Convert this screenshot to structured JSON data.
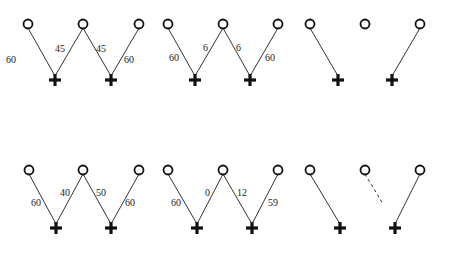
{
  "diagram": {
    "panels": [
      {
        "id": "p1",
        "circles": [
          [
            28,
            24
          ],
          [
            83,
            24
          ],
          [
            139,
            24
          ]
        ],
        "pluses": [
          [
            55,
            80
          ],
          [
            111,
            80
          ]
        ],
        "edges": [
          {
            "from": 0,
            "to": 0,
            "label": "60",
            "lx": 6,
            "ly": 63,
            "style": "solid"
          },
          {
            "from": 1,
            "to": 0,
            "label": "45",
            "lx": 55,
            "ly": 52,
            "style": "solid"
          },
          {
            "from": 1,
            "to": 1,
            "label": "45",
            "lx": 96,
            "ly": 52,
            "style": "solid"
          },
          {
            "from": 2,
            "to": 1,
            "label": "60",
            "lx": 124,
            "ly": 63,
            "style": "solid"
          }
        ]
      },
      {
        "id": "p2",
        "circles": [
          [
            168,
            24
          ],
          [
            223,
            24
          ],
          [
            278,
            24
          ]
        ],
        "pluses": [
          [
            195,
            80
          ],
          [
            250,
            80
          ]
        ],
        "edges": [
          {
            "from": 0,
            "to": 0,
            "label": "60",
            "lx": 169,
            "ly": 61,
            "style": "solid"
          },
          {
            "from": 1,
            "to": 0,
            "label": "6",
            "lx": 203,
            "ly": 51,
            "style": "solid"
          },
          {
            "from": 1,
            "to": 1,
            "label": "6",
            "lx": 236,
            "ly": 51,
            "style": "solid"
          },
          {
            "from": 2,
            "to": 1,
            "label": "60",
            "lx": 265,
            "ly": 61,
            "style": "solid"
          }
        ]
      },
      {
        "id": "p3",
        "circles": [
          [
            310,
            24
          ],
          [
            365,
            24
          ],
          [
            420,
            24
          ]
        ],
        "pluses": [
          [
            338,
            80
          ],
          [
            392,
            80
          ]
        ],
        "edges": [
          {
            "from": 0,
            "to": 0,
            "label": "",
            "style": "solid"
          },
          {
            "from": 2,
            "to": 1,
            "label": "",
            "style": "solid"
          }
        ]
      },
      {
        "id": "p4",
        "circles": [
          [
            29,
            170
          ],
          [
            83,
            170
          ],
          [
            139,
            170
          ]
        ],
        "pluses": [
          [
            56,
            228
          ],
          [
            111,
            228
          ]
        ],
        "edges": [
          {
            "from": 0,
            "to": 0,
            "label": "60",
            "lx": 31,
            "ly": 206,
            "style": "solid"
          },
          {
            "from": 1,
            "to": 0,
            "label": "40",
            "lx": 60,
            "ly": 196,
            "style": "solid"
          },
          {
            "from": 1,
            "to": 1,
            "label": "50",
            "lx": 96,
            "ly": 196,
            "style": "solid"
          },
          {
            "from": 2,
            "to": 1,
            "label": "60",
            "lx": 125,
            "ly": 206,
            "style": "solid"
          }
        ]
      },
      {
        "id": "p5",
        "circles": [
          [
            168,
            170
          ],
          [
            223,
            170
          ],
          [
            278,
            170
          ]
        ],
        "pluses": [
          [
            197,
            228
          ],
          [
            252,
            228
          ]
        ],
        "edges": [
          {
            "from": 0,
            "to": 0,
            "label": "60",
            "lx": 171,
            "ly": 206,
            "style": "solid"
          },
          {
            "from": 1,
            "to": 0,
            "label": "0",
            "lx": 205,
            "ly": 196,
            "style": "solid"
          },
          {
            "from": 1,
            "to": 1,
            "label": "12",
            "lx": 237,
            "ly": 196,
            "style": "solid"
          },
          {
            "from": 2,
            "to": 1,
            "label": "59",
            "lx": 268,
            "ly": 206,
            "style": "solid"
          }
        ]
      },
      {
        "id": "p6",
        "circles": [
          [
            310,
            170
          ],
          [
            365,
            170
          ],
          [
            420,
            170
          ]
        ],
        "pluses": [
          [
            340,
            228
          ],
          [
            395,
            228
          ]
        ],
        "edges": [
          {
            "from": 0,
            "to": 0,
            "label": "",
            "style": "solid"
          },
          {
            "from": 1,
            "partial_to": [
              383,
              204
            ],
            "label": "",
            "style": "dashed"
          },
          {
            "from": 2,
            "to": 1,
            "label": "",
            "style": "solid"
          }
        ]
      }
    ]
  }
}
